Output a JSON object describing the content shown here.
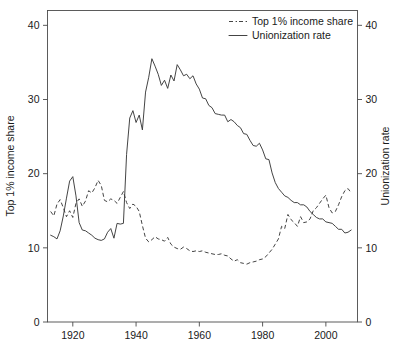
{
  "chart_data": {
    "type": "line",
    "title": "",
    "subtitle": "",
    "xlabel": "",
    "ylabel": "Top 1% income share",
    "y2label": "Unionization rate",
    "xlim": [
      1912,
      2010
    ],
    "ylim": [
      0,
      42
    ],
    "y2lim": [
      0,
      42
    ],
    "grid": false,
    "legend_position": "top-right",
    "xticks": [
      1920,
      1940,
      1960,
      1980,
      2000
    ],
    "xticklabels": [
      "1920",
      "1940",
      "1960",
      "1980",
      "2000"
    ],
    "yticks": [
      0,
      10,
      20,
      30,
      40
    ],
    "yticklabels": [
      "0",
      "10",
      "20",
      "30",
      "40"
    ],
    "y2ticks": [
      0,
      10,
      20,
      30,
      40
    ],
    "y2ticklabels": [
      "0",
      "10",
      "20",
      "30",
      "40"
    ],
    "colors": {
      "line": "#3a3a3a",
      "axis": "#4a4a4a",
      "background": "#ffffff",
      "text": "#1a1a1a"
    },
    "series": [
      {
        "name": "Top 1% income share",
        "style": "dashed",
        "axis": "left",
        "x": [
          1913,
          1914,
          1915,
          1916,
          1917,
          1918,
          1919,
          1920,
          1921,
          1922,
          1923,
          1924,
          1925,
          1926,
          1927,
          1928,
          1929,
          1930,
          1931,
          1932,
          1933,
          1934,
          1935,
          1936,
          1937,
          1938,
          1939,
          1940,
          1941,
          1942,
          1943,
          1944,
          1945,
          1946,
          1947,
          1948,
          1949,
          1950,
          1951,
          1952,
          1953,
          1954,
          1955,
          1956,
          1957,
          1958,
          1959,
          1960,
          1961,
          1962,
          1963,
          1964,
          1965,
          1966,
          1967,
          1968,
          1969,
          1970,
          1971,
          1972,
          1973,
          1974,
          1975,
          1976,
          1977,
          1978,
          1979,
          1980,
          1981,
          1982,
          1983,
          1984,
          1985,
          1986,
          1987,
          1988,
          1989,
          1990,
          1991,
          1992,
          1993,
          1994,
          1995,
          1996,
          1997,
          1998,
          1999,
          2000,
          2001,
          2002,
          2003,
          2004,
          2005,
          2006,
          2007,
          2008
        ],
        "values": [
          14.9,
          14.3,
          15.9,
          16.5,
          15.4,
          14.2,
          15.0,
          14.1,
          16.0,
          16.6,
          15.6,
          16.3,
          17.7,
          17.4,
          18.1,
          19.1,
          18.4,
          16.4,
          16.2,
          16.6,
          16.4,
          16.0,
          16.8,
          17.6,
          16.1,
          15.3,
          15.9,
          15.6,
          14.9,
          13.0,
          11.3,
          10.8,
          11.1,
          11.5,
          11.2,
          11.1,
          10.9,
          11.4,
          10.5,
          10.1,
          9.9,
          9.8,
          10.1,
          9.9,
          9.6,
          9.5,
          9.6,
          9.5,
          9.6,
          9.4,
          9.3,
          9.2,
          9.1,
          9.1,
          9.2,
          9.0,
          8.9,
          8.5,
          8.2,
          8.4,
          8.0,
          7.9,
          7.8,
          8.0,
          8.1,
          8.2,
          8.4,
          8.5,
          8.8,
          9.3,
          9.8,
          10.5,
          11.2,
          12.9,
          12.6,
          14.5,
          13.8,
          13.4,
          12.9,
          14.2,
          13.4,
          13.5,
          13.9,
          15.0,
          15.4,
          16.0,
          16.6,
          17.1,
          15.4,
          14.7,
          14.9,
          15.8,
          16.9,
          17.7,
          18.0,
          17.4
        ]
      },
      {
        "name": "Unionization rate",
        "style": "solid",
        "axis": "right",
        "x": [
          1913,
          1914,
          1915,
          1916,
          1917,
          1918,
          1919,
          1920,
          1921,
          1922,
          1923,
          1924,
          1925,
          1926,
          1927,
          1928,
          1929,
          1930,
          1931,
          1932,
          1933,
          1934,
          1935,
          1936,
          1937,
          1938,
          1939,
          1940,
          1941,
          1942,
          1943,
          1944,
          1945,
          1946,
          1947,
          1948,
          1949,
          1950,
          1951,
          1952,
          1953,
          1954,
          1955,
          1956,
          1957,
          1958,
          1959,
          1960,
          1961,
          1962,
          1963,
          1964,
          1965,
          1966,
          1967,
          1968,
          1969,
          1970,
          1971,
          1972,
          1973,
          1974,
          1975,
          1976,
          1977,
          1978,
          1979,
          1980,
          1981,
          1982,
          1983,
          1984,
          1985,
          1986,
          1987,
          1988,
          1989,
          1990,
          1991,
          1992,
          1993,
          1994,
          1995,
          1996,
          1997,
          1998,
          1999,
          2000,
          2001,
          2002,
          2003,
          2004,
          2005,
          2006,
          2007,
          2008
        ],
        "values": [
          11.7,
          11.5,
          11.2,
          12.3,
          14.3,
          16.7,
          19.0,
          19.6,
          17.0,
          13.4,
          12.4,
          12.3,
          12.0,
          11.7,
          11.3,
          11.1,
          11.0,
          11.2,
          12.1,
          12.6,
          11.3,
          13.3,
          13.2,
          13.3,
          22.6,
          27.5,
          28.5,
          26.9,
          27.9,
          25.9,
          31.0,
          33.0,
          35.5,
          34.5,
          33.4,
          31.9,
          32.6,
          31.5,
          33.3,
          32.5,
          34.7,
          34.0,
          33.2,
          33.4,
          32.8,
          33.2,
          32.1,
          31.4,
          30.2,
          30.1,
          29.2,
          28.9,
          28.1,
          28.0,
          27.9,
          27.9,
          27.0,
          27.3,
          27.0,
          26.5,
          26.2,
          25.4,
          25.3,
          24.5,
          23.8,
          23.7,
          24.1,
          23.2,
          22.0,
          21.9,
          20.1,
          18.8,
          18.0,
          17.5,
          17.0,
          16.8,
          16.4,
          16.1,
          16.1,
          15.8,
          15.8,
          15.5,
          14.9,
          14.5,
          14.1,
          13.9,
          13.9,
          13.5,
          13.4,
          13.3,
          12.9,
          12.5,
          12.5,
          12.0,
          12.1,
          12.4
        ]
      }
    ]
  },
  "legend": {
    "items": [
      {
        "label": "Top 1% income share",
        "style": "dashed"
      },
      {
        "label": "Unionization rate",
        "style": "solid"
      }
    ]
  },
  "axes": {
    "left_title": "Top 1% income share",
    "right_title": "Unionization rate"
  }
}
